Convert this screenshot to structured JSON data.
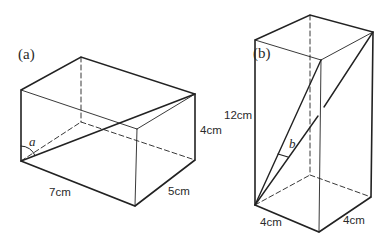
{
  "figure_a": {
    "label": "(a)",
    "angle_label": "a",
    "length_label": "7cm",
    "width_label": "5cm",
    "height_label": "4cm"
  },
  "figure_b": {
    "label": "(b)",
    "angle_label": "b",
    "height_label": "12cm",
    "length_label": "4cm",
    "width_label": "4cm"
  },
  "colors": {
    "line": "#222222",
    "background": "#ffffff"
  }
}
